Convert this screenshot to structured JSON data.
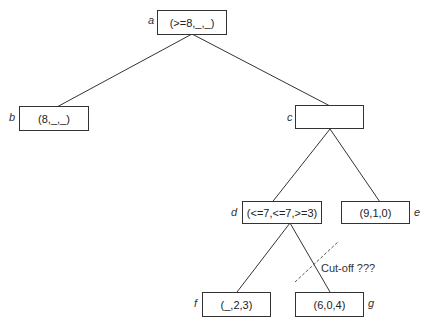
{
  "diagram": {
    "type": "game-tree",
    "nodes": {
      "a": {
        "label": "a",
        "value": "(>=8,_,_)"
      },
      "b": {
        "label": "b",
        "value": "(8,_,_)"
      },
      "c": {
        "label": "c",
        "value": ""
      },
      "d": {
        "label": "d",
        "value": "(<=7,<=7,>=3)"
      },
      "e": {
        "label": "e",
        "value": "(9,1,0)"
      },
      "f": {
        "label": "f",
        "value": "(_,2,3)"
      },
      "g": {
        "label": "g",
        "value": "(6,0,4)"
      }
    },
    "edges": [
      [
        "a",
        "b"
      ],
      [
        "a",
        "c"
      ],
      [
        "c",
        "d"
      ],
      [
        "c",
        "e"
      ],
      [
        "d",
        "f"
      ],
      [
        "d",
        "g"
      ]
    ],
    "annotation": "Cut-off ???",
    "colors": {
      "line": "#333333",
      "cutoff_line": "#555555"
    }
  }
}
